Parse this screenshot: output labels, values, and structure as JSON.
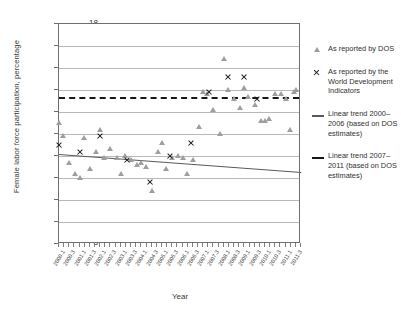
{
  "chart_data": {
    "type": "scatter",
    "title": "",
    "xlabel": "Year",
    "ylabel": "Female labor force participation, percentage",
    "ylim": [
      8,
      18
    ],
    "yticks": [
      8,
      9,
      10,
      11,
      12,
      13,
      14,
      15,
      16,
      17,
      18
    ],
    "grid": true,
    "legend_position": "right",
    "x_categories": [
      "2000.1",
      "2000.3",
      "2001.1",
      "2001.3",
      "2002.1",
      "2002.3",
      "2003.1",
      "2003.3",
      "2004.1",
      "2004.3",
      "2005.1",
      "2005.3",
      "2006.1",
      "2006.3",
      "2007.1",
      "2007.3",
      "2008.1",
      "2008.3",
      "2009.1",
      "2009.3",
      "2010.1",
      "2010.3",
      "2011.1",
      "2011.3"
    ],
    "series": [
      {
        "name": "As reported by DOS",
        "marker": "triangle",
        "color": "#9e9e9e",
        "points": [
          {
            "x": 2000.0,
            "y": 13.5
          },
          {
            "x": 2000.2,
            "y": 12.9
          },
          {
            "x": 2000.5,
            "y": 11.7
          },
          {
            "x": 2000.8,
            "y": 11.2
          },
          {
            "x": 2001.0,
            "y": 11.0
          },
          {
            "x": 2001.2,
            "y": 12.8
          },
          {
            "x": 2001.5,
            "y": 11.4
          },
          {
            "x": 2001.8,
            "y": 12.2
          },
          {
            "x": 2002.0,
            "y": 13.2
          },
          {
            "x": 2002.2,
            "y": 11.9
          },
          {
            "x": 2002.5,
            "y": 12.3
          },
          {
            "x": 2002.8,
            "y": 11.9
          },
          {
            "x": 2003.0,
            "y": 11.2
          },
          {
            "x": 2003.2,
            "y": 12.0
          },
          {
            "x": 2003.5,
            "y": 11.8
          },
          {
            "x": 2003.8,
            "y": 11.6
          },
          {
            "x": 2004.0,
            "y": 11.7
          },
          {
            "x": 2004.2,
            "y": 11.5
          },
          {
            "x": 2004.5,
            "y": 10.4
          },
          {
            "x": 2004.8,
            "y": 12.2
          },
          {
            "x": 2005.0,
            "y": 12.6
          },
          {
            "x": 2005.2,
            "y": 11.4
          },
          {
            "x": 2005.5,
            "y": 11.9
          },
          {
            "x": 2005.8,
            "y": 12.0
          },
          {
            "x": 2006.0,
            "y": 11.9
          },
          {
            "x": 2006.2,
            "y": 11.2
          },
          {
            "x": 2006.5,
            "y": 11.8
          },
          {
            "x": 2006.8,
            "y": 13.3
          },
          {
            "x": 2007.0,
            "y": 14.9
          },
          {
            "x": 2007.2,
            "y": 14.8
          },
          {
            "x": 2007.5,
            "y": 14.1
          },
          {
            "x": 2007.8,
            "y": 13.0
          },
          {
            "x": 2008.0,
            "y": 16.4
          },
          {
            "x": 2008.2,
            "y": 15.0
          },
          {
            "x": 2008.5,
            "y": 14.6
          },
          {
            "x": 2008.8,
            "y": 14.2
          },
          {
            "x": 2009.0,
            "y": 15.1
          },
          {
            "x": 2009.2,
            "y": 14.7
          },
          {
            "x": 2009.5,
            "y": 14.3
          },
          {
            "x": 2009.8,
            "y": 13.6
          },
          {
            "x": 2010.0,
            "y": 13.6
          },
          {
            "x": 2010.2,
            "y": 13.7
          },
          {
            "x": 2010.5,
            "y": 14.8
          },
          {
            "x": 2010.8,
            "y": 14.8
          },
          {
            "x": 2011.0,
            "y": 14.6
          },
          {
            "x": 2011.2,
            "y": 13.2
          },
          {
            "x": 2011.4,
            "y": 14.9
          },
          {
            "x": 2011.5,
            "y": 15.0
          }
        ]
      },
      {
        "name": "As reported by the World Development Indicators",
        "marker": "x",
        "color": "#1d1d1d",
        "points": [
          {
            "x": 2000.0,
            "y": 12.5
          },
          {
            "x": 2001.0,
            "y": 12.2
          },
          {
            "x": 2002.0,
            "y": 12.9
          },
          {
            "x": 2003.3,
            "y": 11.8
          },
          {
            "x": 2004.4,
            "y": 10.8
          },
          {
            "x": 2005.4,
            "y": 12.0
          },
          {
            "x": 2006.4,
            "y": 12.6
          },
          {
            "x": 2007.3,
            "y": 14.9
          },
          {
            "x": 2008.2,
            "y": 15.6
          },
          {
            "x": 2009.0,
            "y": 15.6
          },
          {
            "x": 2009.6,
            "y": 14.6
          }
        ]
      }
    ],
    "trends": [
      {
        "name": "Linear trend 2000-2006 (based on DOS estimates)",
        "style": "solid",
        "color": "#5a5a5a",
        "y_start": 12.1,
        "y_end": 11.28
      },
      {
        "name": "Linear trend 2007-2011 (based on DOS estimates)",
        "style": "dashed",
        "color": "#171717",
        "y_start": 14.7,
        "y_end": 14.7
      }
    ]
  },
  "axes": {
    "y_title": "Female labor force participation, percentage",
    "x_title": "Year"
  },
  "legend": {
    "items": [
      {
        "symbol": "triangle-marker",
        "label": "As reported by DOS"
      },
      {
        "symbol": "x-marker",
        "label": "As reported by the World Development Indicators"
      },
      {
        "symbol": "solid-line",
        "label": "Linear trend 2000–2006 (based on DOS estimates)"
      },
      {
        "symbol": "dashed-line",
        "label": "Linear trend 2007–2011 (based on DOS estimates)"
      }
    ]
  }
}
